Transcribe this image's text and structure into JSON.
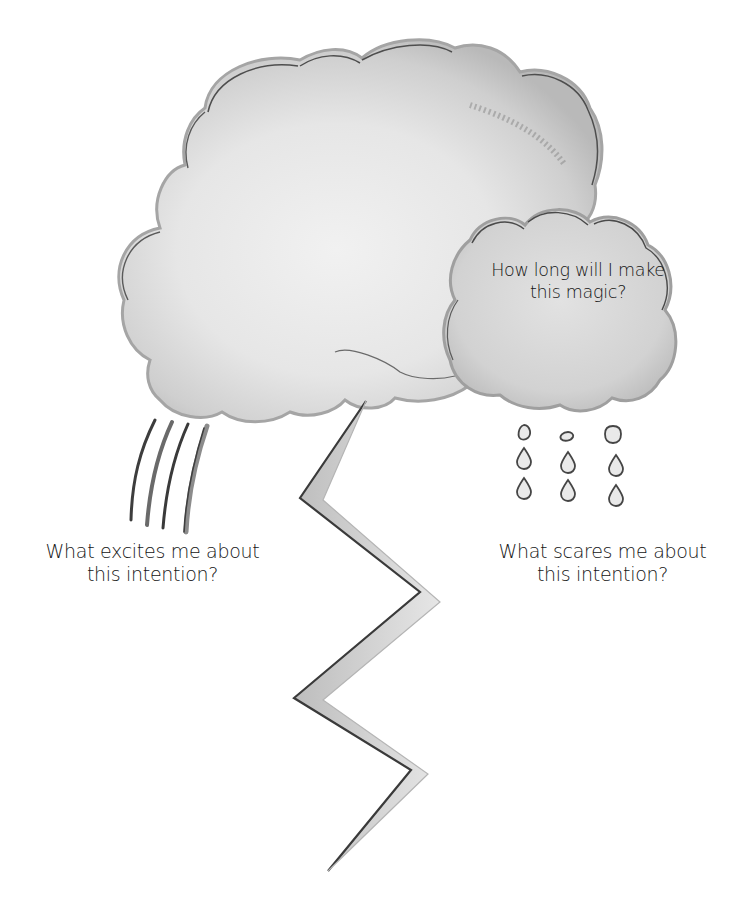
{
  "page": {
    "title_cut_off": "• • • ••••",
    "illustration": {
      "main_cloud": "watercolor-storm-cloud",
      "small_cloud": "watercolor-rain-cloud",
      "rain_streaks": "rain-streaks",
      "lightning": "lightning-bolt",
      "raindrops_count": 9,
      "colors": {
        "cloud_light": "#ececec",
        "cloud_mid": "#cfcfcf",
        "cloud_edge": "#a9a9a9",
        "outline": "#4a4a4a",
        "background": "#ffffff",
        "text": "#151515"
      }
    },
    "prompts": {
      "cloud": {
        "line1": "How long will I make",
        "line2": "this magic?"
      },
      "excites": {
        "line1": "What excites me about",
        "line2": "this intention?"
      },
      "scares": {
        "line1": "What scares me about",
        "line2": "this intention?"
      }
    }
  }
}
